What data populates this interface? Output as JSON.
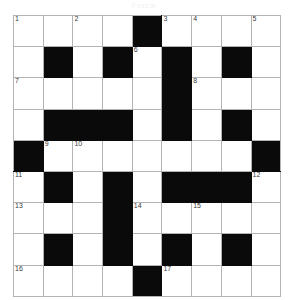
{
  "document": {
    "type": "crossword-puzzle",
    "title": "Puzzle",
    "title_color": "#f2f2f2"
  },
  "grid": {
    "rows": 9,
    "cols": 9,
    "cell_size_px": 29,
    "line_color": "#b3b3b3",
    "block_color": "#0a0a0a",
    "empty_color": "#ffffff",
    "number_color": "#3a3a3a",
    "cells": [
      [
        {
          "type": "open",
          "number": "1",
          "letter": ""
        },
        {
          "type": "open",
          "number": "",
          "letter": ""
        },
        {
          "type": "open",
          "number": "2",
          "letter": ""
        },
        {
          "type": "open",
          "number": "",
          "letter": ""
        },
        {
          "type": "block",
          "number": "",
          "letter": ""
        },
        {
          "type": "open",
          "number": "3",
          "letter": ""
        },
        {
          "type": "open",
          "number": "4",
          "letter": ""
        },
        {
          "type": "open",
          "number": "",
          "letter": ""
        },
        {
          "type": "open",
          "number": "5",
          "letter": ""
        }
      ],
      [
        {
          "type": "open",
          "number": "",
          "letter": ""
        },
        {
          "type": "block",
          "number": "",
          "letter": ""
        },
        {
          "type": "open",
          "number": "",
          "letter": ""
        },
        {
          "type": "block",
          "number": "",
          "letter": ""
        },
        {
          "type": "open",
          "number": "6",
          "letter": ""
        },
        {
          "type": "block",
          "number": "",
          "letter": ""
        },
        {
          "type": "open",
          "number": "",
          "letter": ""
        },
        {
          "type": "block",
          "number": "",
          "letter": ""
        },
        {
          "type": "open",
          "number": "",
          "letter": ""
        }
      ],
      [
        {
          "type": "open",
          "number": "7",
          "letter": ""
        },
        {
          "type": "open",
          "number": "",
          "letter": ""
        },
        {
          "type": "open",
          "number": "",
          "letter": ""
        },
        {
          "type": "open",
          "number": "",
          "letter": ""
        },
        {
          "type": "open",
          "number": "",
          "letter": ""
        },
        {
          "type": "block",
          "number": "",
          "letter": ""
        },
        {
          "type": "open",
          "number": "8",
          "letter": ""
        },
        {
          "type": "open",
          "number": "",
          "letter": ""
        },
        {
          "type": "open",
          "number": "",
          "letter": ""
        }
      ],
      [
        {
          "type": "open",
          "number": "",
          "letter": ""
        },
        {
          "type": "block",
          "number": "",
          "letter": ""
        },
        {
          "type": "block",
          "number": "",
          "letter": ""
        },
        {
          "type": "block",
          "number": "",
          "letter": ""
        },
        {
          "type": "open",
          "number": "",
          "letter": ""
        },
        {
          "type": "block",
          "number": "",
          "letter": ""
        },
        {
          "type": "open",
          "number": "",
          "letter": ""
        },
        {
          "type": "block",
          "number": "",
          "letter": ""
        },
        {
          "type": "open",
          "number": "",
          "letter": ""
        }
      ],
      [
        {
          "type": "block",
          "number": "",
          "letter": ""
        },
        {
          "type": "open",
          "number": "9",
          "letter": ""
        },
        {
          "type": "open",
          "number": "10",
          "letter": ""
        },
        {
          "type": "open",
          "number": "",
          "letter": ""
        },
        {
          "type": "open",
          "number": "",
          "letter": ""
        },
        {
          "type": "open",
          "number": "",
          "letter": ""
        },
        {
          "type": "open",
          "number": "",
          "letter": ""
        },
        {
          "type": "open",
          "number": "",
          "letter": ""
        },
        {
          "type": "block",
          "number": "",
          "letter": ""
        }
      ],
      [
        {
          "type": "open",
          "number": "11",
          "letter": ""
        },
        {
          "type": "block",
          "number": "",
          "letter": ""
        },
        {
          "type": "open",
          "number": "",
          "letter": ""
        },
        {
          "type": "block",
          "number": "",
          "letter": ""
        },
        {
          "type": "open",
          "number": "",
          "letter": ""
        },
        {
          "type": "block",
          "number": "",
          "letter": ""
        },
        {
          "type": "block",
          "number": "",
          "letter": ""
        },
        {
          "type": "block",
          "number": "",
          "letter": ""
        },
        {
          "type": "open",
          "number": "12",
          "letter": ""
        }
      ],
      [
        {
          "type": "open",
          "number": "13",
          "letter": ""
        },
        {
          "type": "open",
          "number": "",
          "letter": ""
        },
        {
          "type": "open",
          "number": "",
          "letter": ""
        },
        {
          "type": "block",
          "number": "",
          "letter": ""
        },
        {
          "type": "open",
          "number": "14",
          "letter": ""
        },
        {
          "type": "open",
          "number": "",
          "letter": ""
        },
        {
          "type": "open",
          "number": "15",
          "letter": ""
        },
        {
          "type": "open",
          "number": "",
          "letter": ""
        },
        {
          "type": "open",
          "number": "",
          "letter": ""
        }
      ],
      [
        {
          "type": "open",
          "number": "",
          "letter": ""
        },
        {
          "type": "block",
          "number": "",
          "letter": ""
        },
        {
          "type": "open",
          "number": "",
          "letter": ""
        },
        {
          "type": "block",
          "number": "",
          "letter": ""
        },
        {
          "type": "open",
          "number": "",
          "letter": ""
        },
        {
          "type": "block",
          "number": "",
          "letter": ""
        },
        {
          "type": "open",
          "number": "",
          "letter": ""
        },
        {
          "type": "block",
          "number": "",
          "letter": ""
        },
        {
          "type": "open",
          "number": "",
          "letter": ""
        }
      ],
      [
        {
          "type": "open",
          "number": "16",
          "letter": ""
        },
        {
          "type": "open",
          "number": "",
          "letter": ""
        },
        {
          "type": "open",
          "number": "",
          "letter": ""
        },
        {
          "type": "open",
          "number": "",
          "letter": ""
        },
        {
          "type": "block",
          "number": "",
          "letter": ""
        },
        {
          "type": "open",
          "number": "17",
          "letter": ""
        },
        {
          "type": "open",
          "number": "",
          "letter": ""
        },
        {
          "type": "open",
          "number": "",
          "letter": ""
        },
        {
          "type": "open",
          "number": "",
          "letter": ""
        }
      ]
    ]
  }
}
